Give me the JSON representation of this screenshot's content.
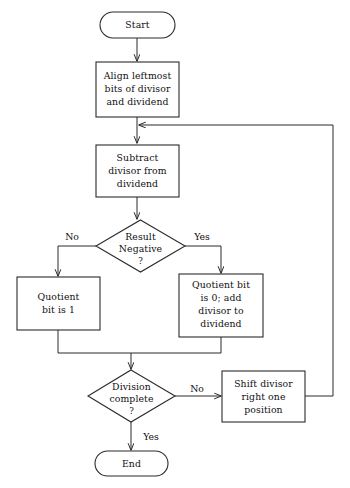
{
  "diagram": {
    "type": "flowchart",
    "stroke_color": "#2b2b2b",
    "text_color": "#101010",
    "background_color": "#ffffff",
    "nodes": [
      {
        "id": "start",
        "shape": "terminator",
        "label": "Start",
        "lines": [
          "Start"
        ]
      },
      {
        "id": "align",
        "shape": "process",
        "label": "Align leftmost bits of divisor and dividend",
        "lines": [
          "Align leftmost",
          "bits of divisor",
          "and dividend"
        ]
      },
      {
        "id": "subtract",
        "shape": "process",
        "label": "Subtract divisor from dividend",
        "lines": [
          "Subtract",
          "divisor from",
          "dividend"
        ]
      },
      {
        "id": "result-negative",
        "shape": "decision",
        "label": "Result Negative ?",
        "lines": [
          "Result",
          "Negative",
          "?"
        ]
      },
      {
        "id": "quotient-one",
        "shape": "process",
        "label": "Quotient bit is 1",
        "lines": [
          "Quotient",
          "bit is 1"
        ]
      },
      {
        "id": "quotient-zero",
        "shape": "process",
        "label": "Quotient bit is 0; add divisor to dividend",
        "lines": [
          "Quotient bit",
          "is 0; add",
          "divisor to",
          "dividend"
        ]
      },
      {
        "id": "division-complete",
        "shape": "decision",
        "label": "Division complete ?",
        "lines": [
          "Division",
          "complete",
          "?"
        ]
      },
      {
        "id": "shift-divisor",
        "shape": "process",
        "label": "Shift divisor right one position",
        "lines": [
          "Shift divisor",
          "right one",
          "position"
        ]
      },
      {
        "id": "end",
        "shape": "terminator",
        "label": "End",
        "lines": [
          "End"
        ]
      }
    ],
    "edge_labels": {
      "result_negative_no": "No",
      "result_negative_yes": "Yes",
      "division_complete_no": "No",
      "division_complete_yes": "Yes"
    }
  }
}
